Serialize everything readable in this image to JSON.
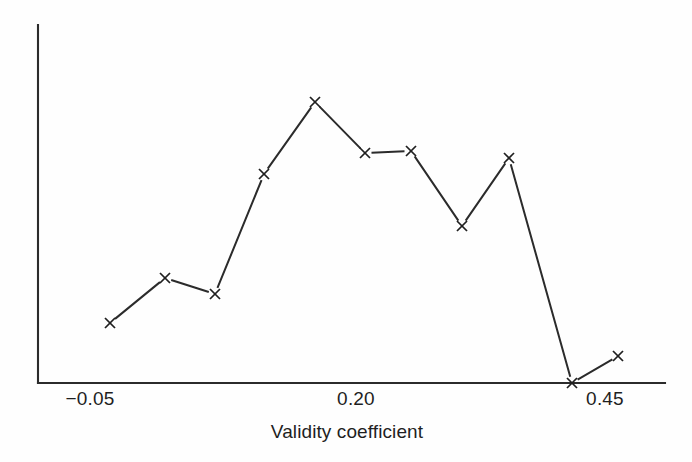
{
  "chart_data": {
    "type": "line",
    "title": "",
    "subtitle": "",
    "xlabel": "Validity coefficient",
    "ylabel": "",
    "grid": false,
    "legend": "none",
    "marker": "x",
    "line_color": "#2b2b2b",
    "axis_color": "#2b2b2b",
    "background": "#fefefe",
    "xlim": [
      -0.073,
      0.508
    ],
    "ylim": [
      0,
      1
    ],
    "xticks": [
      -0.05,
      0.2,
      0.45
    ],
    "xtick_labels": [
      "−0.05",
      "0.20",
      "0.45"
    ],
    "yticks": [],
    "ytick_labels": [],
    "x": [
      -0.031,
      0.022,
      0.07,
      0.117,
      0.166,
      0.214,
      0.259,
      0.308,
      0.353,
      0.414,
      0.458
    ],
    "y": [
      0.167,
      0.293,
      0.248,
      0.584,
      0.785,
      0.642,
      0.648,
      0.438,
      0.626,
      0.0,
      0.081
    ],
    "points_px": [
      {
        "x": 110,
        "y": 323
      },
      {
        "x": 165,
        "y": 278
      },
      {
        "x": 215,
        "y": 294
      },
      {
        "x": 264,
        "y": 174
      },
      {
        "x": 315,
        "y": 102
      },
      {
        "x": 365,
        "y": 153
      },
      {
        "x": 411,
        "y": 151
      },
      {
        "x": 462,
        "y": 226
      },
      {
        "x": 509,
        "y": 158
      },
      {
        "x": 572,
        "y": 383
      },
      {
        "x": 618,
        "y": 356
      }
    ]
  },
  "axes": {
    "x_axis_name": "x-axis",
    "y_axis_name": "y-axis",
    "x_axis_px": {
      "x1": 38,
      "y1": 383,
      "x2": 665,
      "y2": 383
    },
    "y_axis_px": {
      "x1": 38,
      "y1": 25,
      "x2": 38,
      "y2": 383
    }
  },
  "labels": {
    "tick_0": "−0.05",
    "tick_1": "0.20",
    "tick_2": "0.45",
    "axis_title": "Validity coefficient"
  }
}
